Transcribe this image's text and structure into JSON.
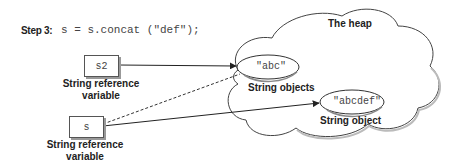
{
  "header": {
    "step_label": "Step 3:",
    "code": "s = s.concat (\"def\");"
  },
  "heap": {
    "title": "The heap",
    "objects": [
      {
        "value": "\"abc\"",
        "caption": "String objects"
      },
      {
        "value": "\"abcdef\"",
        "caption": "String object"
      }
    ]
  },
  "variables": [
    {
      "name": "s2",
      "caption_line1": "String reference",
      "caption_line2": "variable",
      "points_to": "\"abc\"",
      "line_style": "solid"
    },
    {
      "name": "s",
      "caption_line1": "String reference",
      "caption_line2": "variable",
      "points_to": "\"abcdef\"",
      "line_style": "solid",
      "previous_target": "\"abc\"",
      "previous_line_style": "dashed"
    }
  ],
  "colors": {
    "stroke": "#333333",
    "box_shadow": "#999999",
    "background": "#ffffff"
  }
}
